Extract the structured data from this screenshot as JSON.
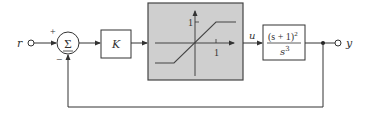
{
  "diagram": {
    "type": "feedback-control-block-diagram",
    "input_label": "r",
    "output_label": "y",
    "summing_junction": {
      "symbol": "Σ",
      "plus_sign": "+",
      "minus_sign": "−"
    },
    "gain_block": {
      "label": "K"
    },
    "saturation_block": {
      "y_tick_label": "1",
      "x_tick_label": "1",
      "fill_color": "#cfcfcf"
    },
    "signal_u_label": "u",
    "plant_block": {
      "numerator": "(s + 1)",
      "numerator_exponent": "2",
      "denominator": "s",
      "denominator_exponent": "3"
    },
    "colors": {
      "line": "#333333",
      "background": "#ffffff"
    }
  }
}
